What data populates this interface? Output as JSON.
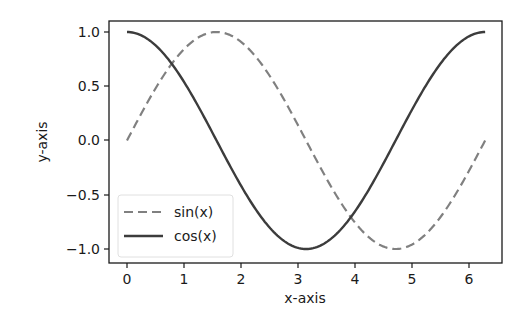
{
  "chart_data": {
    "type": "line",
    "title": "",
    "xlabel": "x-axis",
    "ylabel": "y-axis",
    "xlim": [
      -0.314,
      6.597
    ],
    "ylim": [
      -1.1,
      1.1
    ],
    "xticks": [
      0,
      1,
      2,
      3,
      4,
      5,
      6
    ],
    "xtick_labels": [
      "0",
      "1",
      "2",
      "3",
      "4",
      "5",
      "6"
    ],
    "yticks": [
      1.0,
      0.5,
      0.0,
      -0.5,
      -1.0
    ],
    "ytick_labels": [
      "1.0",
      "0.5",
      "0.0",
      "−0.5",
      "−1.0"
    ],
    "grid": false,
    "legend_position": "lower left",
    "x": [
      0,
      0.3307,
      0.6614,
      0.9921,
      1.3228,
      1.6535,
      1.9842,
      2.3149,
      2.6456,
      2.9762,
      3.3069,
      3.6376,
      3.9683,
      4.299,
      4.6297,
      4.9604,
      5.2911,
      5.6218,
      5.9525,
      6.2832
    ],
    "series": [
      {
        "name": "sin(x)",
        "function": "sin",
        "style": "dashed",
        "color": "#808080",
        "values": [
          0,
          0.3247,
          0.6142,
          0.8372,
          0.9694,
          0.9966,
          0.9158,
          0.7357,
          0.4759,
          0.1646,
          -0.1646,
          -0.4759,
          -0.7357,
          -0.9158,
          -0.9966,
          -0.9694,
          -0.8372,
          -0.6142,
          -0.3247,
          0
        ]
      },
      {
        "name": "cos(x)",
        "function": "cos",
        "style": "solid",
        "color": "#3c3c3c",
        "values": [
          1,
          0.9458,
          0.7891,
          0.5469,
          0.2455,
          -0.0826,
          -0.4017,
          -0.6773,
          -0.8795,
          -0.9864,
          -0.9864,
          -0.8795,
          -0.6773,
          -0.4017,
          -0.0826,
          0.2455,
          0.5469,
          0.7891,
          0.9458,
          1
        ]
      }
    ]
  },
  "legend": {
    "items": [
      {
        "label": "sin(x)"
      },
      {
        "label": "cos(x)"
      }
    ]
  },
  "colors": {
    "frame": "#1a1a1a",
    "sin_line": "#808080",
    "cos_line": "#3c3c3c",
    "legend_border": "#e0e0e0"
  }
}
